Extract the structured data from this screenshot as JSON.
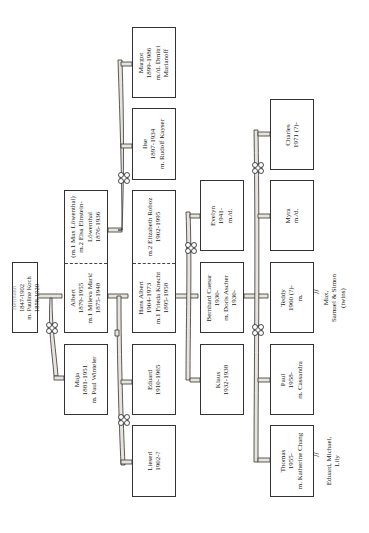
{
  "diagram": {
    "orientation": "rotated-90",
    "generations": [
      {
        "level": 1,
        "members": [
          {
            "id": "hermann",
            "lines": [
              "Hermann",
              "1847-1902",
              "m. Pauline Koch",
              "1858-1920"
            ]
          }
        ]
      },
      {
        "level": 2,
        "members": [
          {
            "id": "albert",
            "lines": [
              "Albert",
              "1879-1955",
              "m.1 Mileva Marić",
              "1875-1948"
            ],
            "spouse2_lines": [
              "(m.1 Max Löwenthal)",
              "m.2 Elsa Einstein-",
              "Löwenthal",
              "1876-1936"
            ]
          },
          {
            "id": "maja",
            "lines": [
              "Maja",
              "1881-1951",
              "m. Paul Winteler"
            ]
          }
        ]
      },
      {
        "level": 3,
        "members": [
          {
            "id": "hans-albert",
            "lines": [
              "Hans Albert",
              "1904-1973",
              "m.1 Frieda Knecht",
              "1895-1958"
            ],
            "spouse2_lines": [
              "m.2 Elizabeth Roboz",
              "1902-1995"
            ]
          },
          {
            "id": "eduard",
            "lines": [
              "Eduard",
              "1910-1965"
            ]
          },
          {
            "id": "lieserl",
            "lines": [
              "Lieserl",
              "1902-?"
            ]
          },
          {
            "id": "ilse",
            "lines": [
              "Ilse",
              "1897-1934",
              "m. Rudolf  Kayser"
            ]
          },
          {
            "id": "margot",
            "lines": [
              "Margot",
              "1899-1986",
              "m./d. Dmitri",
              "Marianoff"
            ]
          }
        ]
      },
      {
        "level": 4,
        "members": [
          {
            "id": "evelyn",
            "lines": [
              "Evelyn",
              "1941-",
              "m./d."
            ]
          },
          {
            "id": "bernhard",
            "lines": [
              "Bernhard Caesar",
              "1930-",
              "m. Doris Ascher",
              "1930-"
            ]
          },
          {
            "id": "klaus",
            "lines": [
              "Klaus",
              "1932-1938"
            ]
          }
        ]
      },
      {
        "level": 5,
        "members": [
          {
            "id": "charles",
            "lines": [
              "Charles",
              "1971 (?)-"
            ]
          },
          {
            "id": "myra",
            "lines": [
              "Myra",
              "m./d."
            ]
          },
          {
            "id": "teddy",
            "lines": [
              "Teddy",
              "1960 (?)-",
              "m."
            ]
          },
          {
            "id": "paul",
            "lines": [
              "Paul",
              "1958-",
              "m. Cassandra"
            ]
          },
          {
            "id": "thomas",
            "lines": [
              "Thomas",
              "1955-",
              "m. Katherine Chang"
            ]
          }
        ]
      }
    ],
    "notes": {
      "teddy_children": [
        "Max,",
        "Samuel & Simon",
        "(twins)"
      ],
      "thomas_children": [
        "Eduard, Michael,",
        "Lily"
      ],
      "descent_marker": "//"
    },
    "colors": {
      "line": "#333333",
      "branch_fill": "#e8e4dc",
      "background": "#ffffff"
    }
  }
}
